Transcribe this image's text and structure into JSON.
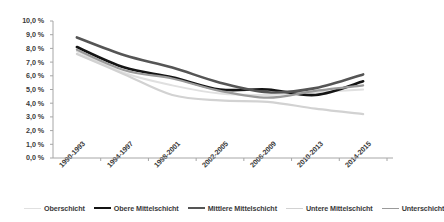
{
  "chart_data": {
    "type": "line",
    "title": "",
    "subtitle": "",
    "xlabel": "",
    "ylabel": "",
    "ylim": [
      0,
      10
    ],
    "grid": false,
    "legend_position": "bottom",
    "categories": [
      "1990-1993",
      "1994-1997",
      "1998-2001",
      "2002-2005",
      "2006-2009",
      "2010-2013",
      "2014-2015"
    ],
    "ytick_labels": [
      "10,0 %",
      "9,0 %",
      "8,0 %",
      "7,0 %",
      "6,0 %",
      "5,0 %",
      "4,0 %",
      "3,0 %",
      "2,0 %",
      "1,0 %",
      "0,0 %"
    ],
    "ytick_values": [
      10,
      9,
      8,
      7,
      6,
      5,
      4,
      3,
      2,
      1,
      0
    ],
    "series": [
      {
        "name": "Oberschicht",
        "color": "#e0e0e0",
        "width": 2.0,
        "values": [
          7.8,
          6.2,
          5.3,
          4.7,
          4.6,
          4.8,
          5.0
        ]
      },
      {
        "name": "Obere Mittelschicht",
        "color": "#141414",
        "width": 2.6,
        "values": [
          8.1,
          6.6,
          5.9,
          5.0,
          5.0,
          4.6,
          5.6
        ]
      },
      {
        "name": "Mittlere Mittelschicht",
        "color": "#555555",
        "width": 2.6,
        "values": [
          8.8,
          7.5,
          6.6,
          5.5,
          4.8,
          5.1,
          6.1
        ]
      },
      {
        "name": "Untere Mittelschicht",
        "color": "#d2d2d2",
        "width": 2.2,
        "values": [
          7.6,
          6.1,
          4.6,
          4.2,
          4.1,
          3.6,
          3.2
        ]
      },
      {
        "name": "Unterschicht",
        "color": "#9a9a9a",
        "width": 2.2,
        "values": [
          7.9,
          6.4,
          5.8,
          4.9,
          4.4,
          4.9,
          5.3
        ]
      }
    ]
  }
}
